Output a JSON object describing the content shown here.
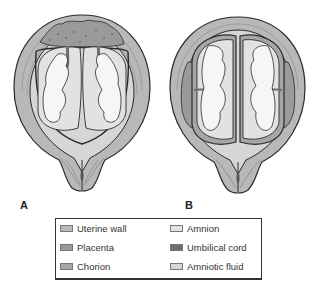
{
  "figures": [
    {
      "id": "A",
      "label": "A",
      "description": "Twins sharing a single fused placenta and a single chorion, each in its own amnion"
    },
    {
      "id": "B",
      "label": "B",
      "description": "Twins each with a separate placenta, chorion and amnion"
    }
  ],
  "legend": {
    "items": [
      {
        "label": "Uterine wall",
        "color": "#b8b8b8"
      },
      {
        "label": "Placenta",
        "color": "#9a9a9a"
      },
      {
        "label": "Chorion",
        "color": "#a6a6a6"
      },
      {
        "label": "Amnion",
        "color": "#e2e2e2"
      },
      {
        "label": "Umbilical cord",
        "color": "#6e6e6e"
      },
      {
        "label": "Amniotic fluid",
        "color": "#d6d6d6"
      }
    ]
  },
  "colors": {
    "uterine_wall": "#b8b8b8",
    "uterine_wall_inner": "#c8c8c8",
    "placenta": "#9a9a9a",
    "chorion": "#a6a6a6",
    "amnion": "#e2e2e2",
    "cord": "#6e6e6e",
    "fluid": "#d6d6d6",
    "fetus": "#f6f6f6",
    "outline": "#2a2a2a"
  }
}
